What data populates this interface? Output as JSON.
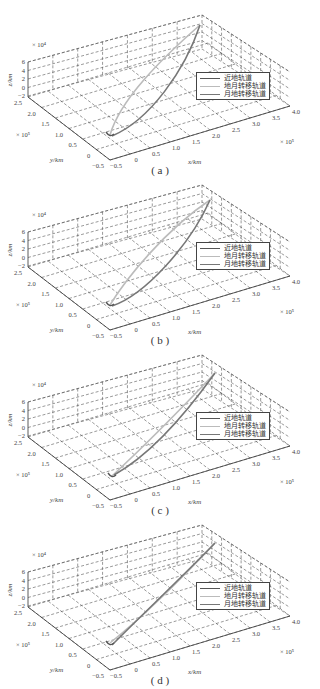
{
  "figure": {
    "panels": [
      {
        "id": "a",
        "caption": "( a )"
      },
      {
        "id": "b",
        "caption": "( b )"
      },
      {
        "id": "c",
        "caption": "( c )"
      },
      {
        "id": "d",
        "caption": "( d )"
      }
    ],
    "legend": {
      "items": [
        {
          "label": "近地轨道",
          "color": "#555555"
        },
        {
          "label": "地月转移轨道",
          "color": "#bbbbbb"
        },
        {
          "label": "月地转移轨道",
          "color": "#777777"
        }
      ]
    },
    "axes": {
      "z_label": "z/km",
      "y_label": "y/km",
      "x_label": "x/km",
      "z_multiplier": "× 10⁴",
      "y_multiplier": "× 10⁵",
      "x_multiplier": "× 10⁵",
      "z_ticks": [
        "6",
        "4",
        "2",
        "0",
        "−2"
      ],
      "y_ticks": [
        "2.5",
        "2.0",
        "1.5",
        "1.0",
        "0.5",
        "0",
        "−0.5"
      ],
      "x_ticks": [
        "−0.5",
        "0",
        "0.5",
        "1.0",
        "1.5",
        "2.0",
        "2.5",
        "3.0",
        "3.5",
        "4.0"
      ]
    }
  },
  "chart_data": [
    {
      "type": "line",
      "title": "(a)",
      "projection": "3d",
      "xlabel": "x/km",
      "ylabel": "y/km",
      "zlabel": "z/km",
      "xlim": [
        -50000.0,
        400000.0
      ],
      "ylim": [
        -50000.0,
        250000.0
      ],
      "zlim": [
        -20000.0,
        60000.0
      ],
      "grid": true,
      "legend_position": "right",
      "series": [
        {
          "name": "近地轨道",
          "points": "small near-Earth loop at origin"
        },
        {
          "name": "地月转移轨道",
          "points": [
            [
              0,
              0,
              0
            ],
            [
              100000.0,
              10000.0,
              5000.0
            ],
            [
              200000.0,
              60000.0,
              15000.0
            ],
            [
              300000.0,
              140000.0,
              30000.0
            ],
            [
              380000.0,
              220000.0,
              50000.0
            ]
          ]
        },
        {
          "name": "月地转移轨道",
          "points": [
            [
              380000.0,
              220000.0,
              50000.0
            ],
            [
              250000.0,
              200000.0,
              35000.0
            ],
            [
              120000.0,
              160000.0,
              20000.0
            ],
            [
              20000.0,
              80000.0,
              5000.0
            ],
            [
              0,
              0,
              0
            ]
          ]
        }
      ]
    },
    {
      "type": "line",
      "title": "(b)",
      "projection": "3d",
      "xlabel": "x/km",
      "ylabel": "y/km",
      "zlabel": "z/km",
      "xlim": [
        -50000.0,
        400000.0
      ],
      "ylim": [
        -50000.0,
        250000.0
      ],
      "zlim": [
        -20000.0,
        60000.0
      ],
      "series": [
        {
          "name": "近地轨道",
          "points": "small loop at origin"
        },
        {
          "name": "地月转移轨道",
          "points": [
            [
              0,
              0,
              0
            ],
            [
              150000.0,
              50000.0,
              10000.0
            ],
            [
              380000.0,
              220000.0,
              50000.0
            ]
          ]
        },
        {
          "name": "月地转移轨道",
          "points": [
            [
              380000.0,
              220000.0,
              50000.0
            ],
            [
              150000.0,
              150000.0,
              25000.0
            ],
            [
              0,
              0,
              0
            ]
          ]
        }
      ]
    },
    {
      "type": "line",
      "title": "(c)",
      "projection": "3d",
      "xlabel": "x/km",
      "ylabel": "y/km",
      "zlabel": "z/km",
      "xlim": [
        -50000.0,
        400000.0
      ],
      "ylim": [
        -50000.0,
        250000.0
      ],
      "zlim": [
        -20000.0,
        60000.0
      ],
      "series": [
        {
          "name": "近地轨道",
          "points": "small loop at origin"
        },
        {
          "name": "地月转移轨道",
          "points": [
            [
              0,
              0,
              0
            ],
            [
              200000.0,
              80000.0,
              15000.0
            ],
            [
              380000.0,
              220000.0,
              50000.0
            ]
          ]
        },
        {
          "name": "月地转移轨道",
          "points": [
            [
              380000.0,
              220000.0,
              50000.0
            ],
            [
              180000.0,
              120000.0,
              25000.0
            ],
            [
              0,
              0,
              0
            ]
          ]
        }
      ]
    },
    {
      "type": "line",
      "title": "(d)",
      "projection": "3d",
      "xlabel": "x/km",
      "ylabel": "y/km",
      "zlabel": "z/km",
      "xlim": [
        -50000.0,
        400000.0
      ],
      "ylim": [
        -50000.0,
        250000.0
      ],
      "zlim": [
        -20000.0,
        60000.0
      ],
      "series": [
        {
          "name": "近地轨道",
          "points": "small loop at origin"
        },
        {
          "name": "地月转移轨道",
          "points": [
            [
              0,
              0,
              0
            ],
            [
              190000.0,
              110000.0,
              25000.0
            ],
            [
              380000.0,
              220000.0,
              50000.0
            ]
          ]
        },
        {
          "name": "月地转移轨道",
          "points": [
            [
              380000.0,
              220000.0,
              50000.0
            ],
            [
              190000.0,
              105000.0,
              25000.0
            ],
            [
              0,
              0,
              0
            ]
          ]
        }
      ]
    }
  ]
}
